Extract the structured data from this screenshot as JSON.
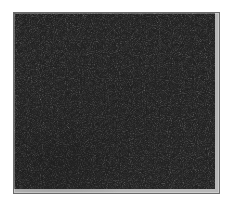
{
  "page": {
    "background_color": "#ffffff",
    "width": 234,
    "height": 206
  },
  "figure": {
    "name": "micrograph-panel",
    "caption": "",
    "title": "",
    "border_color": "#6b6b6b",
    "border_width_px": 1,
    "panel": {
      "left": 13,
      "top": 12,
      "width": 207,
      "height": 182
    },
    "texture": {
      "description": "fine-grained random speckle",
      "base_color": "#b4b4b4",
      "dark_speckle_color": "#2a2a2a",
      "mid_speckle_color": "#4a4a4a",
      "light_ground_color": "#e0e0e0",
      "mean_tone": "#9a9a9a",
      "grain_size_px": 1.5,
      "clustering": "slight",
      "streak_direction": "diagonal",
      "dark_region": "lower-left"
    }
  },
  "labels": {
    "axis_ticks": [],
    "legend": [],
    "annotations": [],
    "margin_text": ""
  }
}
